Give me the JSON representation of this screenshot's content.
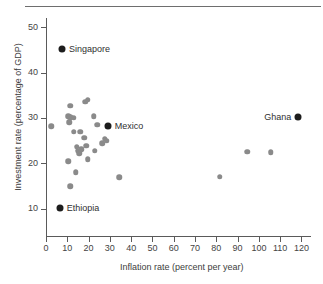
{
  "chart_data": {
    "type": "scatter",
    "title": "",
    "xlabel": "Inflation rate (percent per year)",
    "ylabel": "Investment rate (percentage of GDP)",
    "xlim": [
      0,
      124
    ],
    "ylim": [
      4,
      52
    ],
    "xticks": [
      0,
      10,
      20,
      30,
      40,
      50,
      60,
      70,
      80,
      90,
      100,
      110,
      120
    ],
    "yticks": [
      10,
      20,
      30,
      40,
      50
    ],
    "grid": false,
    "legend": "none",
    "colors": {
      "plain_point": "#8a8a8a",
      "labeled_point": "#1d1d1d",
      "axis": "#5a5a5a",
      "text": "#3d3d3d"
    },
    "labeled_points": [
      {
        "name": "Singapore",
        "x": 7.5,
        "y": 45.2,
        "label_side": "right"
      },
      {
        "name": "Mexico",
        "x": 29,
        "y": 28.2,
        "label_side": "right"
      },
      {
        "name": "Ghana",
        "x": 118.5,
        "y": 30.2,
        "label_side": "left"
      },
      {
        "name": "Ethiopia",
        "x": 6.5,
        "y": 10.2,
        "label_side": "right"
      }
    ],
    "points": [
      {
        "x": 2.5,
        "y": 28.2
      },
      {
        "x": 11.5,
        "y": 32.7
      },
      {
        "x": 18.5,
        "y": 33.6
      },
      {
        "x": 19.5,
        "y": 34.0
      },
      {
        "x": 10.5,
        "y": 30.4
      },
      {
        "x": 11.5,
        "y": 30.1
      },
      {
        "x": 11.0,
        "y": 29.1
      },
      {
        "x": 13.0,
        "y": 30.0
      },
      {
        "x": 22.5,
        "y": 30.4
      },
      {
        "x": 24.0,
        "y": 28.5
      },
      {
        "x": 13.0,
        "y": 26.9
      },
      {
        "x": 16.0,
        "y": 26.9
      },
      {
        "x": 18.0,
        "y": 25.6
      },
      {
        "x": 27.5,
        "y": 25.4
      },
      {
        "x": 28.5,
        "y": 25.0
      },
      {
        "x": 26.5,
        "y": 24.4
      },
      {
        "x": 14.5,
        "y": 23.6
      },
      {
        "x": 15.0,
        "y": 22.8
      },
      {
        "x": 15.5,
        "y": 22.2
      },
      {
        "x": 16.5,
        "y": 23.1
      },
      {
        "x": 19.0,
        "y": 23.9
      },
      {
        "x": 23.0,
        "y": 22.8
      },
      {
        "x": 10.5,
        "y": 20.5
      },
      {
        "x": 19.5,
        "y": 20.9
      },
      {
        "x": 14.0,
        "y": 18.0
      },
      {
        "x": 11.5,
        "y": 14.9
      },
      {
        "x": 34.5,
        "y": 16.9
      },
      {
        "x": 81.5,
        "y": 17.0
      },
      {
        "x": 94.5,
        "y": 22.6
      },
      {
        "x": 105.5,
        "y": 22.4
      }
    ]
  }
}
